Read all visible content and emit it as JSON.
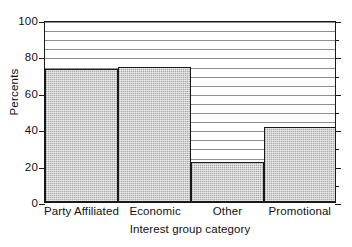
{
  "chart_data": {
    "type": "bar",
    "title": "",
    "subtitle": "",
    "xlabel": "Interest group category",
    "ylabel": "Percents",
    "categories": [
      "Party Affiliated",
      "Economic",
      "Other",
      "Promotional"
    ],
    "values": [
      73,
      74,
      22,
      41
    ],
    "ylim": [
      0,
      100
    ],
    "yticks": [
      0,
      20,
      40,
      60,
      80,
      100
    ],
    "ytick_labels": [
      "0",
      "20",
      "40",
      "60",
      "80",
      "100"
    ],
    "grid": true,
    "grid_interval": 5,
    "grid_axis": "y",
    "legend": "none",
    "bar_fill_color": "#d2d2d2",
    "bar_edge_color": "#1a1a1a",
    "axis_color": "#1a1a1a",
    "gridline_color": "#8d8d8d",
    "background_color": "#ffffff"
  }
}
